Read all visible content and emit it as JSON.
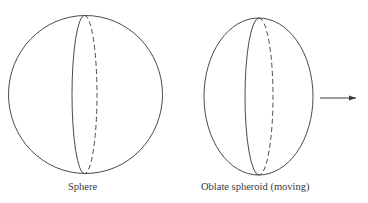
{
  "figure": {
    "stroke_color": "#4a4a4a",
    "background": "#ffffff",
    "shapes": [
      {
        "name": "sphere",
        "label": "Sphere",
        "outline": {
          "cx": 85.5,
          "cy": 94.5,
          "rx": 77,
          "ry": 79
        },
        "meridian": {
          "cx": 84.5,
          "cy": 94.5,
          "rx": 12.5,
          "ry": 79,
          "front": "solid-left",
          "back": "dashed-right"
        }
      },
      {
        "name": "oblate-spheroid",
        "label": "Oblate spheroid (moving)",
        "outline": {
          "cx": 258.5,
          "cy": 96.5,
          "rx": 54.5,
          "ry": 78.5
        },
        "meridian": {
          "cx": 259,
          "cy": 96.5,
          "rx": 14,
          "ry": 78.5,
          "front": "solid-left",
          "back": "dashed-right"
        }
      }
    ],
    "motion_arrow": {
      "x1": 320,
      "y1": 98,
      "x2": 356,
      "y2": 98,
      "direction": "right"
    }
  }
}
